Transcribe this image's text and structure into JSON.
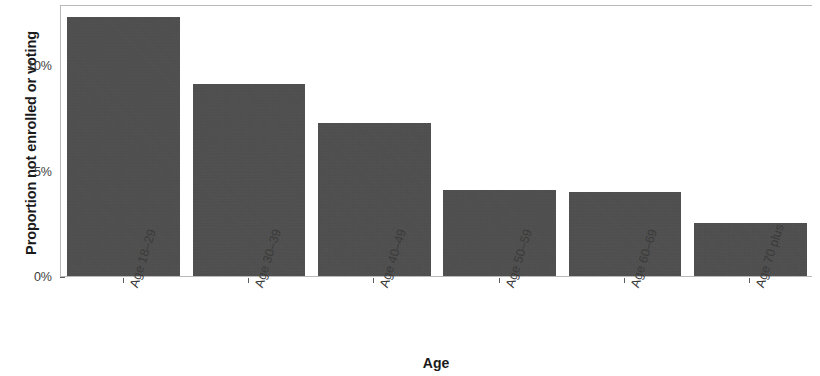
{
  "chart_data": {
    "type": "bar",
    "title": "",
    "subtitle": "",
    "xlabel": "Age",
    "ylabel": "Proportion not enrolled or voting",
    "categories": [
      "Age 18–29",
      "Age 30–39",
      "Age 40–49",
      "Age 50–59",
      "Age 60–69",
      "Age 70 plus"
    ],
    "values": [
      12.3,
      9.1,
      7.25,
      4.1,
      4.0,
      2.5
    ],
    "value_labels": [
      "12.3%",
      "9.1%",
      "7.25%",
      "4.1%",
      "4.0%",
      "2.5%"
    ],
    "ylim": [
      0,
      12.9
    ],
    "ytick_values": [
      0,
      5,
      10
    ],
    "ytick_labels": [
      "0%",
      "5%",
      "10%"
    ],
    "bar_color": "#4b4b4b",
    "panel_border_color": "#b9b9b9",
    "axis_text_color": "#3b3b3b",
    "grid": false,
    "legend": false,
    "legend_position": "none"
  },
  "axes": {
    "y": {
      "title": "Proportion not enrolled or voting",
      "ticks": [
        {
          "label": "0%",
          "value": 0
        },
        {
          "label": "5%",
          "value": 5
        },
        {
          "label": "10%",
          "value": 10
        }
      ]
    },
    "x": {
      "title": "Age",
      "ticks": [
        {
          "label": "Age 18–29"
        },
        {
          "label": "Age 30–39"
        },
        {
          "label": "Age 40–49"
        },
        {
          "label": "Age 50–59"
        },
        {
          "label": "Age 60–69"
        },
        {
          "label": "Age 70 plus"
        }
      ]
    }
  }
}
